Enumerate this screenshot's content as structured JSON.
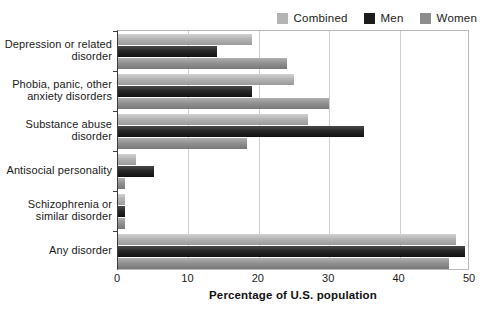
{
  "legend": {
    "position": "top-right",
    "items": [
      {
        "label": "Combined",
        "color": "#b4b4b4",
        "key": "combined"
      },
      {
        "label": "Men",
        "color": "#1c1c1c",
        "key": "men"
      },
      {
        "label": "Women",
        "color": "#8d8d8d",
        "key": "women"
      }
    ]
  },
  "axis": {
    "x_ticks": [
      "0",
      "10",
      "20",
      "30",
      "40",
      "50"
    ],
    "x_title": "Percentage of U.S. population"
  },
  "chart_data": {
    "type": "bar",
    "orientation": "horizontal",
    "title": "",
    "xlabel": "Percentage of U.S. population",
    "ylabel": "",
    "xlim": [
      0,
      50
    ],
    "xticks": [
      0,
      10,
      20,
      30,
      40,
      50
    ],
    "grid": true,
    "legend_position": "top-right",
    "categories": [
      "Depression or related disorder",
      "Phobia, panic, other anxiety disorders",
      "Substance abuse disorder",
      "Antisocial personality",
      "Schizophrenia or similar disorder",
      "Any disorder"
    ],
    "category_lines": [
      [
        "Depression or related",
        "disorder"
      ],
      [
        "Phobia, panic, other",
        "anxiety disorders"
      ],
      [
        "Substance abuse",
        "disorder"
      ],
      [
        "Antisocial personality"
      ],
      [
        "Schizophrenia or",
        "similar disorder"
      ],
      [
        "Any disorder"
      ]
    ],
    "series": [
      {
        "name": "Combined",
        "color": "#b4b4b4",
        "values": [
          19,
          25,
          27,
          2.6,
          1,
          48
        ]
      },
      {
        "name": "Men",
        "color": "#1c1c1c",
        "values": [
          14,
          19,
          35,
          5.1,
          1,
          49.3
        ]
      },
      {
        "name": "Women",
        "color": "#8d8d8d",
        "values": [
          24,
          30,
          18.3,
          1,
          1,
          47
        ]
      }
    ]
  }
}
